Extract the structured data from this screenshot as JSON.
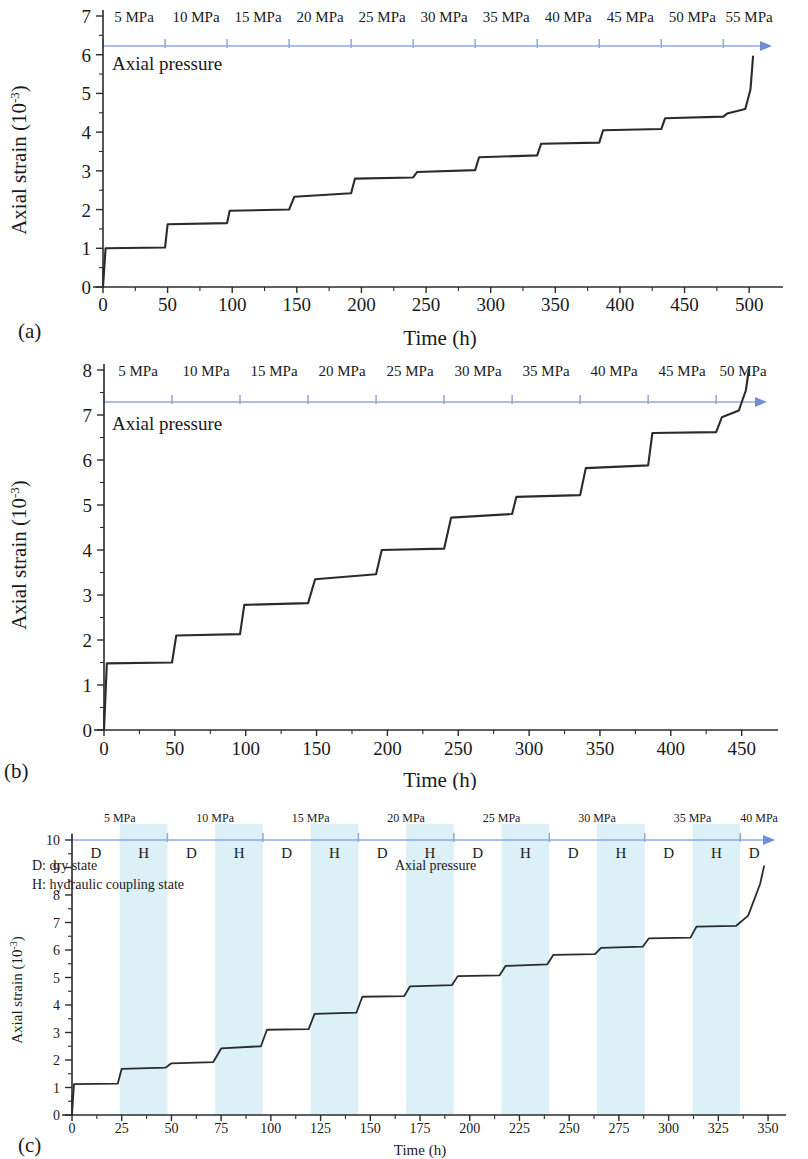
{
  "figure": {
    "panels": [
      {
        "id": "a",
        "label": "(a)",
        "xlabel": "Time (h)",
        "ylabel": "Axial strain (10",
        "ylabel_sup": "-3",
        "ylabel_close": ")",
        "pressure_label": "Axial pressure",
        "pressure_steps": [
          "5 MPa",
          "10 MPa",
          "15 MPa",
          "20 MPa",
          "25 MPa",
          "30 MPa",
          "35 MPa",
          "40 MPa",
          "45 MPa",
          "50 MPa",
          "55 MPa"
        ],
        "yticks": [
          "0",
          "1",
          "2",
          "3",
          "4",
          "5",
          "6",
          "7"
        ],
        "xticks": [
          "0",
          "50",
          "100",
          "150",
          "200",
          "250",
          "300",
          "350",
          "400",
          "450",
          "500"
        ]
      },
      {
        "id": "b",
        "label": "(b)",
        "xlabel": "Time (h)",
        "ylabel": "Axial strain (10",
        "ylabel_sup": "-3",
        "ylabel_close": ")",
        "pressure_label": "Axial pressure",
        "pressure_steps": [
          "5 MPa",
          "10 MPa",
          "15 MPa",
          "20 MPa",
          "25 MPa",
          "30 MPa",
          "35 MPa",
          "40 MPa",
          "45 MPa",
          "50 MPa"
        ],
        "yticks": [
          "0",
          "1",
          "2",
          "3",
          "4",
          "5",
          "6",
          "7",
          "8"
        ],
        "xticks": [
          "0",
          "50",
          "100",
          "150",
          "200",
          "250",
          "300",
          "350",
          "400",
          "450"
        ]
      },
      {
        "id": "c",
        "label": "(c)",
        "xlabel": "Time (h)",
        "ylabel": "Axial strain (10",
        "ylabel_sup": "-3",
        "ylabel_close": ")",
        "pressure_label": "Axial pressure",
        "pressure_steps": [
          "5 MPa",
          "10 MPa",
          "15 MPa",
          "20 MPa",
          "25 MPa",
          "30 MPa",
          "35 MPa",
          "40 MPa"
        ],
        "state_sequence": [
          "D",
          "H",
          "D",
          "H",
          "D",
          "H",
          "D",
          "H",
          "D",
          "H",
          "D",
          "H",
          "D",
          "H",
          "D"
        ],
        "legend": [
          "D: dry state",
          "H: hydraulic coupling state"
        ],
        "yticks": [
          "0",
          "1",
          "2",
          "3",
          "4",
          "5",
          "6",
          "7",
          "8",
          "9",
          "10"
        ],
        "xticks": [
          "0",
          "25",
          "50",
          "75",
          "100",
          "125",
          "150",
          "175",
          "200",
          "225",
          "250",
          "275",
          "300",
          "325",
          "350"
        ]
      }
    ]
  },
  "chart_data": [
    {
      "type": "line",
      "id": "a",
      "title": "(a) Multi-stage creep, dry state, up to 55 MPa",
      "xlabel": "Time (h)",
      "ylabel": "Axial strain (10^-3)",
      "xlim": [
        0,
        520
      ],
      "ylim": [
        0,
        7
      ],
      "grid": false,
      "legend": "none",
      "pressure_axis": {
        "label": "Axial pressure",
        "steps_mpa": [
          5,
          10,
          15,
          20,
          25,
          30,
          35,
          40,
          45,
          50,
          55
        ],
        "step_start_hours": [
          0,
          48,
          96,
          144,
          192,
          240,
          288,
          336,
          384,
          432,
          480
        ]
      },
      "stage_strain_start": [
        1.0,
        1.62,
        1.97,
        2.33,
        2.8,
        2.97,
        3.35,
        3.7,
        4.05,
        4.36,
        4.48
      ],
      "stage_strain_end": [
        1.02,
        1.65,
        2.0,
        2.42,
        2.83,
        3.02,
        3.4,
        3.73,
        4.08,
        4.4,
        5.95
      ],
      "failure_strain": 5.95,
      "failure_time_h": 503,
      "x": [
        0,
        2,
        48,
        50,
        96,
        98,
        144,
        148,
        192,
        195,
        240,
        243,
        288,
        291,
        336,
        339,
        384,
        387,
        432,
        435,
        480,
        483,
        497,
        501,
        503
      ],
      "y": [
        0,
        1.0,
        1.02,
        1.62,
        1.65,
        1.97,
        2.0,
        2.33,
        2.42,
        2.8,
        2.83,
        2.97,
        3.02,
        3.35,
        3.4,
        3.7,
        3.73,
        4.05,
        4.08,
        4.36,
        4.4,
        4.48,
        4.6,
        5.1,
        5.95
      ]
    },
    {
      "type": "line",
      "id": "b",
      "title": "(b) Multi-stage creep, hydraulic coupling, up to 50 MPa",
      "xlabel": "Time (h)",
      "ylabel": "Axial strain (10^-3)",
      "xlim": [
        0,
        470
      ],
      "ylim": [
        0,
        8
      ],
      "grid": false,
      "legend": "none",
      "pressure_axis": {
        "label": "Axial pressure",
        "steps_mpa": [
          5,
          10,
          15,
          20,
          25,
          30,
          35,
          40,
          45,
          50
        ],
        "step_start_hours": [
          0,
          48,
          96,
          144,
          192,
          240,
          288,
          336,
          384,
          432
        ]
      },
      "stage_strain_start": [
        1.48,
        2.1,
        2.78,
        3.35,
        4.0,
        4.72,
        5.18,
        5.82,
        6.6,
        6.95
      ],
      "stage_strain_end": [
        1.5,
        2.13,
        2.82,
        3.46,
        4.03,
        4.8,
        5.22,
        5.88,
        6.62,
        8.0
      ],
      "failure_strain": 8.0,
      "failure_time_h": 455,
      "x": [
        0,
        2,
        48,
        51,
        96,
        99,
        144,
        149,
        192,
        196,
        240,
        245,
        288,
        291,
        336,
        340,
        384,
        387,
        432,
        436,
        448,
        453,
        455
      ],
      "y": [
        0,
        1.48,
        1.5,
        2.1,
        2.13,
        2.78,
        2.82,
        3.35,
        3.46,
        4.0,
        4.03,
        4.72,
        4.8,
        5.18,
        5.22,
        5.82,
        5.88,
        6.6,
        6.62,
        6.95,
        7.1,
        7.55,
        8.0
      ]
    },
    {
      "type": "line",
      "id": "c",
      "title": "(c) Alternating dry / hydraulic coupling creep, up to 40 MPa",
      "xlabel": "Time (h)",
      "ylabel": "Axial strain (10^-3)",
      "xlim": [
        0,
        355
      ],
      "ylim": [
        0,
        10
      ],
      "grid": false,
      "legend_entries": [
        "D: dry state",
        "H: hydraulic coupling state"
      ],
      "pressure_axis": {
        "label": "Axial pressure",
        "steps_mpa": [
          5,
          10,
          15,
          20,
          25,
          30,
          35,
          40
        ],
        "step_start_hours": [
          0,
          48,
          96,
          144,
          192,
          240,
          288,
          336
        ]
      },
      "state_bands": [
        {
          "state": "D",
          "start_h": 0,
          "end_h": 24
        },
        {
          "state": "H",
          "start_h": 24,
          "end_h": 48
        },
        {
          "state": "D",
          "start_h": 48,
          "end_h": 72
        },
        {
          "state": "H",
          "start_h": 72,
          "end_h": 96
        },
        {
          "state": "D",
          "start_h": 96,
          "end_h": 120
        },
        {
          "state": "H",
          "start_h": 120,
          "end_h": 144
        },
        {
          "state": "D",
          "start_h": 144,
          "end_h": 168
        },
        {
          "state": "H",
          "start_h": 168,
          "end_h": 192
        },
        {
          "state": "D",
          "start_h": 192,
          "end_h": 216
        },
        {
          "state": "H",
          "start_h": 216,
          "end_h": 240
        },
        {
          "state": "D",
          "start_h": 240,
          "end_h": 264
        },
        {
          "state": "H",
          "start_h": 264,
          "end_h": 288
        },
        {
          "state": "D",
          "start_h": 288,
          "end_h": 312
        },
        {
          "state": "H",
          "start_h": 312,
          "end_h": 336
        },
        {
          "state": "D",
          "start_h": 336,
          "end_h": 350
        }
      ],
      "stage_strain_start": [
        1.12,
        1.68,
        1.88,
        2.42,
        3.1,
        3.68,
        4.3,
        4.68,
        5.05,
        5.42,
        5.82,
        6.08,
        6.42,
        6.85
      ],
      "stage_strain_end": [
        1.14,
        1.72,
        1.92,
        2.5,
        3.12,
        3.72,
        4.32,
        4.72,
        5.08,
        5.48,
        5.85,
        6.12,
        6.45,
        9.05
      ],
      "failure_strain": 9.05,
      "failure_time_h": 348,
      "x": [
        0,
        1,
        23,
        25,
        47,
        50,
        71,
        75,
        95,
        98,
        119,
        122,
        143,
        146,
        167,
        170,
        191,
        194,
        215,
        218,
        239,
        242,
        263,
        266,
        287,
        290,
        311,
        314,
        334,
        340,
        346,
        348
      ],
      "y": [
        0,
        1.12,
        1.14,
        1.68,
        1.72,
        1.88,
        1.92,
        2.42,
        2.5,
        3.1,
        3.12,
        3.68,
        3.72,
        4.3,
        4.32,
        4.68,
        4.72,
        5.05,
        5.08,
        5.42,
        5.48,
        5.82,
        5.85,
        6.08,
        6.12,
        6.42,
        6.45,
        6.85,
        6.88,
        7.25,
        8.4,
        9.05
      ]
    }
  ],
  "colors": {
    "curve": "#2b2b2b",
    "pressure_axis": "#8fa8dd",
    "pressure_arrow": "#6f8fd4",
    "band_hydraulic": "#dcf0f8",
    "text": "#1a1a1a"
  }
}
